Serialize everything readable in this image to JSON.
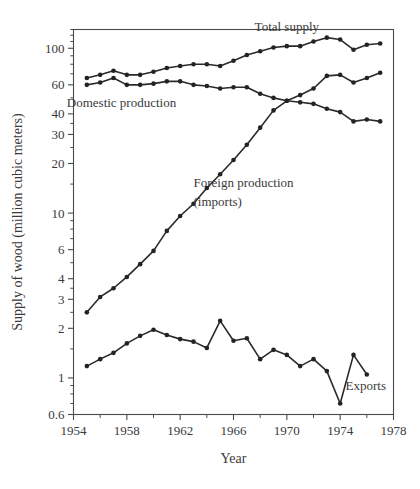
{
  "chart_data": {
    "type": "line",
    "title": "",
    "xlabel": "Year",
    "ylabel": "Supply of wood (million cubic meters)",
    "yscale": "log",
    "xlim": [
      1954,
      1978
    ],
    "ylim": [
      0.6,
      130
    ],
    "grid": false,
    "legend_position": "inline-annotations",
    "y_tick_labels": [
      "100",
      "60",
      "40",
      "30",
      "20",
      "10",
      "6",
      "4",
      "3",
      "2",
      "1",
      "0.6"
    ],
    "y_tick_values": [
      100,
      60,
      40,
      30,
      20,
      10,
      6,
      4,
      3,
      2,
      1,
      0.6
    ],
    "y_minor_tick_values": [
      0.7,
      0.8,
      0.9,
      1.5,
      2.5,
      3.5,
      5,
      7,
      8,
      9,
      15,
      25,
      35,
      50,
      70,
      80,
      90,
      110,
      120,
      130
    ],
    "x_tick_labels": [
      "1954",
      "1958",
      "1962",
      "1966",
      "1970",
      "1974",
      "1978"
    ],
    "x_tick_values": [
      1954,
      1958,
      1962,
      1966,
      1970,
      1974,
      1978
    ],
    "x_minor_tick_values": [
      1956,
      1960,
      1964,
      1968,
      1972,
      1976
    ],
    "series": [
      {
        "name": "Total supply",
        "label": "Total supply",
        "label_x": 1970.0,
        "label_y": 128,
        "x": [
          1955,
          1956,
          1957,
          1958,
          1959,
          1960,
          1961,
          1962,
          1963,
          1964,
          1965,
          1966,
          1967,
          1968,
          1969,
          1970,
          1971,
          1972,
          1973,
          1974,
          1975,
          1976,
          1977
        ],
        "values": [
          66,
          69,
          73,
          69,
          69,
          72,
          76,
          78,
          80,
          80,
          78,
          84,
          91,
          96,
          101,
          103,
          103,
          110,
          116,
          113,
          98,
          105,
          107
        ]
      },
      {
        "name": "Domestic production",
        "label": "Domestic production",
        "label_x": 1957.6,
        "label_y": 44,
        "x": [
          1955,
          1956,
          1957,
          1958,
          1959,
          1960,
          1961,
          1962,
          1963,
          1964,
          1965,
          1966,
          1967,
          1968,
          1969,
          1970,
          1971,
          1972,
          1973,
          1974,
          1975,
          1976,
          1977
        ],
        "values": [
          60,
          62,
          66,
          60,
          60,
          61,
          63,
          63,
          60,
          59,
          57,
          58,
          58,
          53,
          50,
          48,
          47,
          46,
          43,
          41,
          36,
          37,
          36
        ]
      },
      {
        "name": "Foreign production (imports)",
        "label": "Foreign production",
        "label2": "(imports)",
        "label_x": 1963.0,
        "label_y": 14.5,
        "label2_y": 11.0,
        "x": [
          1955,
          1956,
          1957,
          1958,
          1959,
          1960,
          1961,
          1962,
          1963,
          1964,
          1965,
          1966,
          1967,
          1968,
          1969,
          1970,
          1971,
          1972,
          1973,
          1974,
          1975,
          1976,
          1977
        ],
        "values": [
          2.5,
          3.1,
          3.5,
          4.1,
          4.9,
          5.9,
          7.8,
          9.6,
          11.4,
          14.2,
          17.2,
          21,
          26,
          33,
          42,
          48,
          52,
          57,
          68,
          69,
          62,
          66,
          71
        ]
      },
      {
        "name": "Exports",
        "label": "Exports",
        "label_x": 1974.4,
        "label_y": 0.84,
        "x": [
          1955,
          1956,
          1957,
          1958,
          1959,
          1960,
          1961,
          1962,
          1963,
          1964,
          1965,
          1966,
          1967,
          1968,
          1969,
          1970,
          1971,
          1972,
          1973,
          1974,
          1975,
          1976
        ],
        "values": [
          1.18,
          1.3,
          1.42,
          1.62,
          1.8,
          1.96,
          1.82,
          1.72,
          1.66,
          1.52,
          2.22,
          1.68,
          1.74,
          1.3,
          1.48,
          1.38,
          1.18,
          1.3,
          1.1,
          0.7,
          1.38,
          1.05
        ]
      }
    ]
  }
}
